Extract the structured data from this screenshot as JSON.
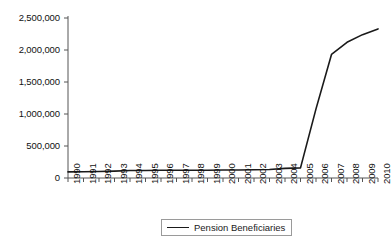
{
  "chart_data": {
    "type": "line",
    "title": "",
    "xlabel": "",
    "ylabel": "",
    "grid": false,
    "legend_position": "bottom-center",
    "xlim": [
      1990,
      2010
    ],
    "ylim": [
      0,
      2500000
    ],
    "ytick_labels": [
      "2,500,000",
      "2,000,000",
      "1,500,000",
      "1,000,000",
      "500,000",
      "0"
    ],
    "ytick_values": [
      2500000,
      2000000,
      1500000,
      1000000,
      500000,
      0
    ],
    "categories": [
      "1990",
      "1991",
      "1992",
      "1993",
      "1994",
      "1995",
      "1996",
      "1997",
      "1998",
      "1999",
      "2000",
      "2001",
      "2002",
      "2003",
      "2004",
      "2005",
      "2006",
      "2007",
      "2008",
      "2009",
      "2010"
    ],
    "series": [
      {
        "name": "Pension Beneficiaries",
        "color": "#1a1a1a",
        "values": [
          95000,
          98000,
          102000,
          108000,
          118000,
          118000,
          120000,
          120000,
          121000,
          122000,
          124000,
          126000,
          128000,
          132000,
          150000,
          158000,
          1080000,
          1930000,
          2120000,
          2240000,
          2330000
        ]
      }
    ],
    "legend": [
      {
        "label": "Pension Beneficiaries",
        "color": "#1a1a1a"
      }
    ]
  },
  "axis": {
    "line_color": "#555555"
  }
}
